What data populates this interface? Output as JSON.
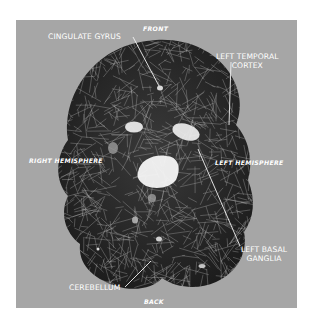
{
  "figure": {
    "background_color": "#a6a6a6",
    "mesh_fill_color": "#2b2b2b",
    "mesh_line_color": "#b9b9b9",
    "highlight_color": "#f4f4f4"
  },
  "orientation_labels": {
    "front": "FRONT",
    "back": "BACK",
    "right_hemisphere": "RIGHT HEMISPHERE",
    "left_hemisphere": "LEFT HEMISPHERE"
  },
  "anatomy_labels": {
    "cingulate_gyrus": "CINGULATE GYRUS",
    "left_temporal_cortex_line1": "LEFT TEMPORAL",
    "left_temporal_cortex_line2": "CORTEX",
    "left_basal_ganglia_line1": "LEFT BASAL",
    "left_basal_ganglia_line2": "GANGLIA",
    "cerebellum": "CEREBELLUM"
  }
}
